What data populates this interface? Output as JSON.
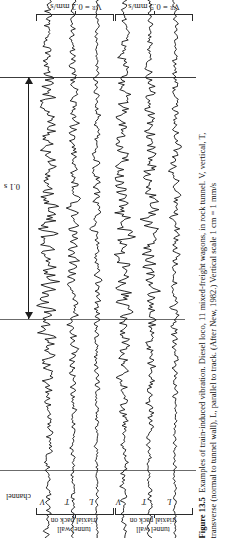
{
  "figure": {
    "number": "Figure 13.5",
    "caption_line1": "Examples of train-induced vibration. Diesel loco, 11 mixed-freight wagons, in rock tunnel. V, vertical, T,",
    "caption_line2": "transverse (normal to tunnel wall), L, parallel to track. (After New, 1982.) Vertical scale 1 cm = 1 mm/s"
  },
  "amplitude_labels": {
    "group_left": "Vᴿ = 0.2 mm/s",
    "group_right": "Vᴿ = 0.5 mm/s",
    "symbol": "V",
    "subscript": "R",
    "left_value": "0.2 mm/s",
    "right_value": "0.5 mm/s"
  },
  "axis": {
    "time_scale_label": "0.1 s",
    "channel_header": "channel"
  },
  "groups": [
    {
      "id": "group-left",
      "amplitude": "V_R = 0.2 mm/s",
      "bracket_label": "triaxial pack on\ntunnel wall",
      "bracket_label_line1": "triaxial pack on",
      "bracket_label_line2": "tunnel wall",
      "channels": [
        "V",
        "T",
        "L"
      ]
    },
    {
      "id": "group-right",
      "amplitude": "V_R = 0.5 mm/s",
      "bracket_label": "triaxial pack on\ntunnel wall",
      "bracket_label_line1": "triaxial pack on",
      "bracket_label_line2": "tunnel wall",
      "channels": [
        "V",
        "T",
        "L"
      ]
    }
  ],
  "chart_data": {
    "type": "line",
    "title": "Examples of train-induced vibration",
    "xlabel": "time",
    "ylabel": "particle velocity",
    "orientation": "traces run vertically; time increases downward",
    "time_marker_interval": "0.1 s",
    "grid": false,
    "legend": "none",
    "reference_lines_y_px": [
      77,
      319,
      470
    ],
    "series": [
      {
        "name": "Group 1 – V (vertical)",
        "group": "V_R = 0.2 mm/s",
        "channel": "V",
        "x_px": 48,
        "amplitude_rel": 1.0
      },
      {
        "name": "Group 1 – T (transverse)",
        "group": "V_R = 0.2 mm/s",
        "channel": "T",
        "x_px": 73,
        "amplitude_rel": 0.6
      },
      {
        "name": "Group 1 – L (parallel)",
        "group": "V_R = 0.2 mm/s",
        "channel": "L",
        "x_px": 97,
        "amplitude_rel": 0.45
      },
      {
        "name": "Group 2 – V (vertical)",
        "group": "V_R = 0.5 mm/s",
        "channel": "V",
        "x_px": 124,
        "amplitude_rel": 0.85
      },
      {
        "name": "Group 2 – T (transverse)",
        "group": "V_R = 0.5 mm/s",
        "channel": "T",
        "x_px": 150,
        "amplitude_rel": 0.75
      },
      {
        "name": "Group 2 – L (parallel)",
        "group": "V_R = 0.5 mm/s",
        "channel": "L",
        "x_px": 175,
        "amplitude_rel": 0.5
      }
    ]
  },
  "colors": {
    "background": "#ffffff",
    "trace": "#111111",
    "reference_line": "#3c3c3c",
    "text": "#1a1a1a"
  }
}
